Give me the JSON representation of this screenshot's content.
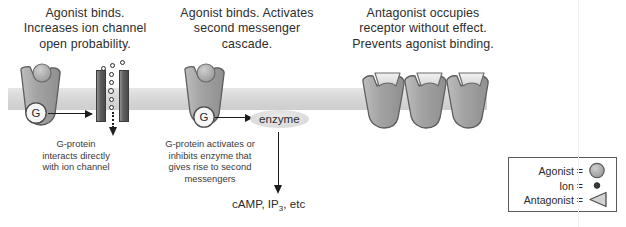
{
  "diagram": {
    "title_panels": [
      {
        "id": "panel-ionotropic",
        "heading": "Agonist binds.\nIncreases ion channel\nopen probability.",
        "caption": "G-protein\ninteracts directly\nwith ion channel"
      },
      {
        "id": "panel-metabotropic",
        "heading": "Agonist binds. Activates\nsecond messenger\ncascade.",
        "caption": "G-protein activates or\ninhibits enzyme that\ngives rise to second\nmessengers"
      },
      {
        "id": "panel-antagonist",
        "heading": "Antagonist occupies\nreceptor without effect.\nPrevents agonist binding.",
        "caption": ""
      }
    ],
    "g_protein_label": "G",
    "enzyme_label": "enzyme",
    "second_messengers": "cAMP, IP3, etc",
    "second_messengers_parts": {
      "pre": "cAMP, IP",
      "sub": "3",
      "post": ", etc"
    },
    "legend": {
      "rows": [
        {
          "label": "Agonist =",
          "glyph": "circle-icon"
        },
        {
          "label": "Ion =",
          "glyph": "dot-icon"
        },
        {
          "label": "Antagonist =",
          "glyph": "triangle-icon"
        }
      ]
    },
    "colors": {
      "membrane": "#d8d8d8",
      "receptor_fill": "#a8a8a8",
      "receptor_stroke": "#5d5d5d",
      "agonist_fill": "#adadad",
      "antagonist_fill": "#e2e2e2",
      "channel_fill": "#555555",
      "arrow": "#1c1c1c",
      "text": "#2b2b2b"
    }
  }
}
